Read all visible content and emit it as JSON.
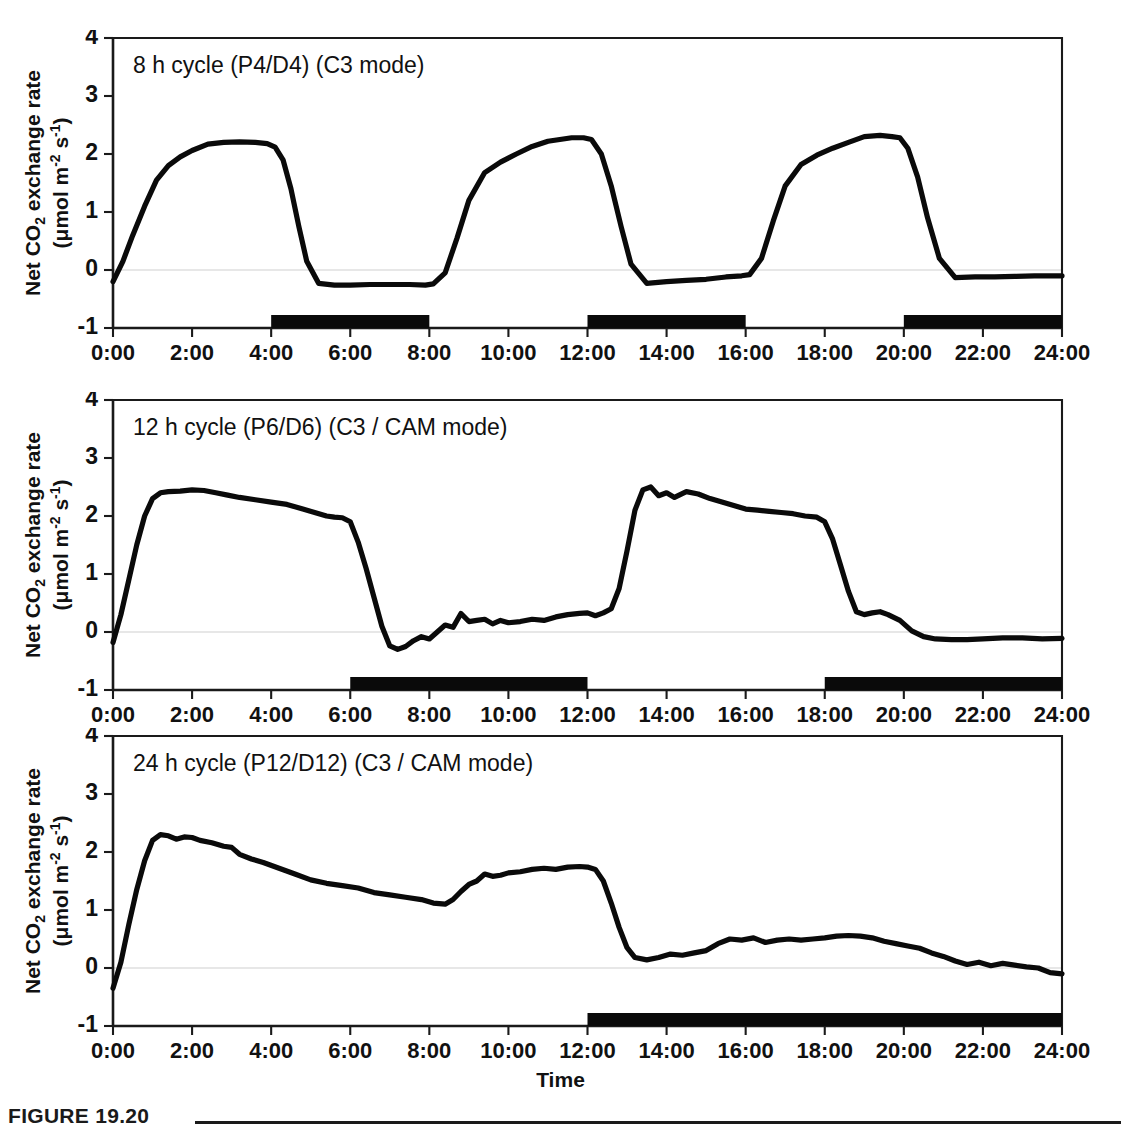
{
  "figure": {
    "caption_label": "FIGURE 19.20",
    "xaxis_title": "Time",
    "yaxis_title_line1_pre": "Net CO",
    "yaxis_title_line1_sub": "2",
    "yaxis_title_line1_post": " exchange rate",
    "yaxis_title_line2_pre": "(μmol m",
    "yaxis_title_line2_sup1": "-2",
    "yaxis_title_line2_mid": " s",
    "yaxis_title_line2_sup2": "-1",
    "yaxis_title_line2_post": ")"
  },
  "axis": {
    "ytick_labels": [
      "4",
      "3",
      "2",
      "1",
      "0",
      "-1"
    ],
    "ytick_values": [
      4,
      3,
      2,
      1,
      0,
      -1
    ],
    "ylim": [
      -1,
      4
    ],
    "xtick_labels": [
      "0:00",
      "2:00",
      "4:00",
      "6:00",
      "8:00",
      "10:00",
      "12:00",
      "14:00",
      "16:00",
      "18:00",
      "20:00",
      "22:00",
      "24:00"
    ],
    "xtick_values": [
      0,
      2,
      4,
      6,
      8,
      10,
      12,
      14,
      16,
      18,
      20,
      22,
      24
    ],
    "xlim": [
      0,
      24
    ],
    "grid": "zero-line-only",
    "legend": "none"
  },
  "chart_data": [
    {
      "type": "line",
      "panel_index": 0,
      "title": "8 h cycle (P4/D4) (C3 mode)",
      "xlabel": "Time",
      "ylabel": "Net CO2 exchange rate (μmol m-2 s-1)",
      "xlim": [
        0,
        24
      ],
      "ylim": [
        -1,
        4
      ],
      "dark_bars": [
        [
          4,
          8
        ],
        [
          12,
          16
        ],
        [
          20,
          24
        ]
      ],
      "x": [
        0,
        0.25,
        0.5,
        0.8,
        1.1,
        1.4,
        1.7,
        2.0,
        2.4,
        2.8,
        3.2,
        3.6,
        3.9,
        4.1,
        4.3,
        4.5,
        4.7,
        4.9,
        5.2,
        5.6,
        6.0,
        6.5,
        7.0,
        7.5,
        7.9,
        8.1,
        8.4,
        8.7,
        9.0,
        9.4,
        9.8,
        10.2,
        10.6,
        11.0,
        11.3,
        11.6,
        11.9,
        12.1,
        12.35,
        12.6,
        12.85,
        13.1,
        13.5,
        14.0,
        14.5,
        15.0,
        15.5,
        15.9,
        16.1,
        16.4,
        16.7,
        17.0,
        17.4,
        17.8,
        18.2,
        18.6,
        19.0,
        19.4,
        19.7,
        19.9,
        20.1,
        20.35,
        20.6,
        20.9,
        21.3,
        21.8,
        22.3,
        22.8,
        23.3,
        23.8,
        24.0
      ],
      "y": [
        -0.2,
        0.15,
        0.6,
        1.1,
        1.55,
        1.8,
        1.95,
        2.06,
        2.17,
        2.2,
        2.21,
        2.2,
        2.18,
        2.12,
        1.9,
        1.4,
        0.75,
        0.15,
        -0.23,
        -0.26,
        -0.26,
        -0.25,
        -0.25,
        -0.25,
        -0.26,
        -0.24,
        -0.05,
        0.55,
        1.2,
        1.68,
        1.86,
        2.0,
        2.13,
        2.22,
        2.25,
        2.28,
        2.28,
        2.25,
        2.0,
        1.45,
        0.75,
        0.1,
        -0.23,
        -0.2,
        -0.18,
        -0.16,
        -0.12,
        -0.1,
        -0.08,
        0.2,
        0.85,
        1.45,
        1.82,
        1.98,
        2.1,
        2.2,
        2.3,
        2.32,
        2.3,
        2.28,
        2.1,
        1.6,
        0.9,
        0.2,
        -0.13,
        -0.12,
        -0.12,
        -0.11,
        -0.1,
        -0.1,
        -0.1
      ]
    },
    {
      "type": "line",
      "panel_index": 1,
      "title": "12 h cycle (P6/D6) (C3 / CAM mode)",
      "xlabel": "Time",
      "ylabel": "Net CO2 exchange rate (μmol m-2 s-1)",
      "xlim": [
        0,
        24
      ],
      "ylim": [
        -1,
        4
      ],
      "dark_bars": [
        [
          6,
          12
        ],
        [
          18,
          24
        ]
      ],
      "x": [
        0,
        0.2,
        0.4,
        0.6,
        0.8,
        1.0,
        1.2,
        1.4,
        1.7,
        2.0,
        2.3,
        2.6,
        2.9,
        3.2,
        3.6,
        4.0,
        4.4,
        4.8,
        5.1,
        5.4,
        5.6,
        5.8,
        6.0,
        6.2,
        6.4,
        6.6,
        6.8,
        7.0,
        7.2,
        7.4,
        7.6,
        7.8,
        8.0,
        8.2,
        8.4,
        8.6,
        8.8,
        9.0,
        9.2,
        9.4,
        9.6,
        9.8,
        10.0,
        10.3,
        10.6,
        10.9,
        11.2,
        11.5,
        11.8,
        12.0,
        12.2,
        12.4,
        12.6,
        12.8,
        13.0,
        13.2,
        13.4,
        13.6,
        13.8,
        14.0,
        14.2,
        14.5,
        14.8,
        15.1,
        15.4,
        15.7,
        16.0,
        16.3,
        16.6,
        16.9,
        17.2,
        17.5,
        17.8,
        18.0,
        18.2,
        18.4,
        18.6,
        18.8,
        19.0,
        19.2,
        19.4,
        19.6,
        19.9,
        20.2,
        20.5,
        20.8,
        21.2,
        21.6,
        22.0,
        22.5,
        23.0,
        23.5,
        24.0
      ],
      "y": [
        -0.18,
        0.3,
        0.9,
        1.5,
        2.0,
        2.3,
        2.4,
        2.42,
        2.43,
        2.45,
        2.44,
        2.4,
        2.36,
        2.32,
        2.28,
        2.24,
        2.2,
        2.12,
        2.06,
        2.0,
        1.98,
        1.97,
        1.9,
        1.55,
        1.1,
        0.6,
        0.1,
        -0.24,
        -0.3,
        -0.25,
        -0.15,
        -0.08,
        -0.12,
        0.0,
        0.12,
        0.08,
        0.32,
        0.18,
        0.2,
        0.22,
        0.14,
        0.2,
        0.16,
        0.18,
        0.22,
        0.2,
        0.26,
        0.3,
        0.32,
        0.33,
        0.28,
        0.33,
        0.4,
        0.75,
        1.4,
        2.1,
        2.45,
        2.5,
        2.35,
        2.4,
        2.32,
        2.42,
        2.38,
        2.3,
        2.24,
        2.18,
        2.12,
        2.1,
        2.08,
        2.06,
        2.04,
        2.0,
        1.98,
        1.9,
        1.6,
        1.15,
        0.7,
        0.35,
        0.3,
        0.33,
        0.35,
        0.3,
        0.2,
        0.02,
        -0.08,
        -0.12,
        -0.13,
        -0.13,
        -0.12,
        -0.1,
        -0.1,
        -0.12,
        -0.11
      ]
    },
    {
      "type": "line",
      "panel_index": 2,
      "title": "24 h cycle (P12/D12) (C3 / CAM mode)",
      "xlabel": "Time",
      "ylabel": "Net CO2 exchange rate (μmol m-2 s-1)",
      "xlim": [
        0,
        24
      ],
      "ylim": [
        -1,
        4
      ],
      "dark_bars": [
        [
          12,
          24
        ]
      ],
      "x": [
        0,
        0.2,
        0.4,
        0.6,
        0.8,
        1.0,
        1.2,
        1.4,
        1.6,
        1.8,
        2.0,
        2.2,
        2.5,
        2.8,
        3.0,
        3.2,
        3.5,
        3.8,
        4.2,
        4.6,
        5.0,
        5.4,
        5.8,
        6.2,
        6.6,
        7.0,
        7.4,
        7.8,
        8.1,
        8.4,
        8.6,
        8.8,
        9.0,
        9.2,
        9.4,
        9.6,
        9.8,
        10.0,
        10.3,
        10.6,
        10.9,
        11.2,
        11.5,
        11.8,
        12.0,
        12.2,
        12.4,
        12.6,
        12.8,
        13.0,
        13.2,
        13.5,
        13.8,
        14.1,
        14.4,
        14.7,
        15.0,
        15.3,
        15.6,
        15.9,
        16.2,
        16.5,
        16.8,
        17.1,
        17.4,
        17.7,
        18.0,
        18.3,
        18.6,
        18.9,
        19.2,
        19.5,
        19.8,
        20.1,
        20.4,
        20.7,
        21.0,
        21.3,
        21.6,
        21.9,
        22.2,
        22.5,
        22.8,
        23.1,
        23.4,
        23.7,
        24.0
      ],
      "y": [
        -0.35,
        0.1,
        0.75,
        1.35,
        1.85,
        2.2,
        2.3,
        2.28,
        2.22,
        2.26,
        2.25,
        2.2,
        2.16,
        2.1,
        2.08,
        1.96,
        1.88,
        1.82,
        1.72,
        1.62,
        1.52,
        1.46,
        1.42,
        1.38,
        1.3,
        1.26,
        1.22,
        1.18,
        1.12,
        1.1,
        1.18,
        1.32,
        1.44,
        1.5,
        1.62,
        1.58,
        1.6,
        1.64,
        1.66,
        1.7,
        1.72,
        1.7,
        1.74,
        1.75,
        1.74,
        1.7,
        1.5,
        1.12,
        0.7,
        0.35,
        0.18,
        0.14,
        0.18,
        0.24,
        0.22,
        0.26,
        0.3,
        0.42,
        0.5,
        0.48,
        0.52,
        0.44,
        0.48,
        0.5,
        0.48,
        0.5,
        0.52,
        0.55,
        0.56,
        0.55,
        0.52,
        0.46,
        0.42,
        0.38,
        0.34,
        0.26,
        0.2,
        0.12,
        0.06,
        0.1,
        0.04,
        0.08,
        0.05,
        0.02,
        0.0,
        -0.08,
        -0.1
      ]
    }
  ]
}
